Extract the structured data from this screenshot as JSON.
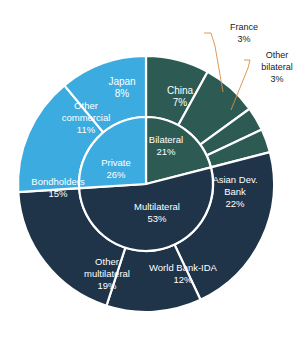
{
  "chart_data": {
    "type": "pie",
    "title": "",
    "subtitle": "",
    "xlabel": "",
    "ylabel": "",
    "legend_position": "none",
    "grid": false,
    "variant": "nested-donut",
    "units": "percent",
    "rings": [
      {
        "name": "inner",
        "categories": [
          "Bilateral",
          "Multilateral",
          "Private"
        ],
        "values": [
          21,
          53,
          26
        ],
        "colors": [
          "#2d5b53",
          "#1f3349",
          "#3cabe0"
        ]
      },
      {
        "name": "outer",
        "categories": [
          "Japan",
          "China",
          "France",
          "Other bilateral",
          "Asian Dev. Bank",
          "World Bank-IDA",
          "Other multilateral",
          "Bondholders",
          "Other commercial"
        ],
        "values": [
          8,
          7,
          3,
          3,
          22,
          12,
          19,
          15,
          11
        ],
        "colors": [
          "#2d5b53",
          "#2d5b53",
          "#2d5b53",
          "#2d5b53",
          "#1f3349",
          "#1f3349",
          "#1f3349",
          "#3cabe0",
          "#3cabe0"
        ],
        "parents": [
          "Bilateral",
          "Bilateral",
          "Bilateral",
          "Bilateral",
          "Multilateral",
          "Multilateral",
          "Multilateral",
          "Private",
          "Private"
        ]
      }
    ],
    "slices": [
      {
        "label": "Bilateral",
        "value_text": "21%",
        "value": 21,
        "ring": "inner",
        "color": "#2d5b53"
      },
      {
        "label": "Multilateral",
        "value_text": "53%",
        "value": 53,
        "ring": "inner",
        "color": "#1f3349"
      },
      {
        "label": "Private",
        "value_text": "26%",
        "value": 26,
        "ring": "inner",
        "color": "#3cabe0"
      },
      {
        "label": "Japan",
        "value_text": "8%",
        "value": 8,
        "ring": "outer",
        "color": "#2d5b53"
      },
      {
        "label": "China",
        "value_text": "7%",
        "value": 7,
        "ring": "outer",
        "color": "#2d5b53"
      },
      {
        "label": "France",
        "value_text": "3%",
        "value": 3,
        "ring": "outer",
        "color": "#2d5b53",
        "callout": true
      },
      {
        "label": "Other bilateral",
        "value_text": "3%",
        "value": 3,
        "ring": "outer",
        "color": "#2d5b53",
        "callout": true
      },
      {
        "label": "Asian Dev. Bank",
        "value_text": "22%",
        "value": 22,
        "ring": "outer",
        "color": "#1f3349"
      },
      {
        "label": "World Bank-IDA",
        "value_text": "12%",
        "value": 12,
        "ring": "outer",
        "color": "#1f3349"
      },
      {
        "label": "Other multilateral",
        "value_text": "19%",
        "value": 19,
        "ring": "outer",
        "color": "#1f3349"
      },
      {
        "label": "Bondholders",
        "value_text": "15%",
        "value": 15,
        "ring": "outer",
        "color": "#3cabe0"
      },
      {
        "label": "Other commercial",
        "value_text": "11%",
        "value": 11,
        "ring": "outer",
        "color": "#3cabe0"
      }
    ]
  },
  "labels": {
    "inner": {
      "bilateral_name": "Bilateral",
      "bilateral_pct": "21%",
      "multilateral_name": "Multilateral",
      "multilateral_pct": "53%",
      "private_name": "Private",
      "private_pct": "26%"
    },
    "outer": {
      "japan_name": "Japan",
      "japan_pct": "8%",
      "china_name": "China",
      "china_pct": "7%",
      "adb_name_line1": "Asian Dev.",
      "adb_name_line2": "Bank",
      "adb_pct": "22%",
      "wb_name": "World Bank-IDA",
      "wb_pct": "12%",
      "othermulti_name_line1": "Other",
      "othermulti_name_line2": "multilateral",
      "othermulti_pct": "19%",
      "bondholders_name": "Bondholders",
      "bondholders_pct": "15%",
      "othercomm_name_line1": "Other",
      "othercomm_name_line2": "commercial",
      "othercomm_pct": "11%"
    },
    "callouts": {
      "france_name": "France",
      "france_pct": "3%",
      "otherbilat_name_line1": "Other",
      "otherbilat_name_line2": "bilateral",
      "otherbilat_pct": "3%"
    }
  },
  "colors": {
    "teal": "#2d5b53",
    "navy": "#1f3349",
    "lightblue": "#3cabe0",
    "separator": "#ffffff",
    "leader_line": "#d98f3f",
    "label_text": "#ffffff",
    "callout_text": "#1a1a1a",
    "background": "#ffffff"
  }
}
